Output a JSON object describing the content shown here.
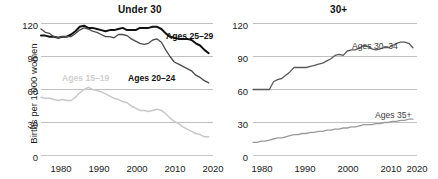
{
  "figure": {
    "ylabel": "Births per 1,000 women"
  },
  "panels": {
    "left": {
      "title": "Under 30",
      "yticks": [
        "120",
        "90",
        "60",
        "30",
        "0"
      ],
      "xticks": [
        "1980",
        "1990",
        "2000",
        "2010",
        "2020"
      ],
      "labels": {
        "ages_25_29": "Ages 25–29",
        "ages_20_24": "Ages 20–24",
        "ages_15_19": "Ages 15–19"
      }
    },
    "right": {
      "title": "30+",
      "yticks": [
        "120",
        "90",
        "60",
        "30",
        "0"
      ],
      "xticks": [
        "1980",
        "1990",
        "2000",
        "2010",
        "2020"
      ],
      "labels": {
        "ages_30_34": "Ages 30–34",
        "ages_35_plus": "Ages 35+"
      }
    }
  },
  "colors": {
    "ages_25_29": "#111111",
    "ages_20_24": "#4a4a4a",
    "ages_15_19": "#c8c8c8",
    "ages_30_34": "#5a5a5a",
    "ages_35_plus": "#9a9a9a",
    "gridline": "#b9b9b9",
    "axis_text": "#1a1a1a"
  },
  "chart_data": {
    "type": "line",
    "xlabel": "",
    "ylabel": "Births per 1,000 women",
    "xlim": [
      1980,
      2020
    ],
    "ylim": [
      0,
      120
    ],
    "grid": "horizontal",
    "legend": "inline-annotations",
    "panels": [
      {
        "name": "Under 30",
        "yticks": [
          0,
          30,
          60,
          90,
          120
        ],
        "xticks": [
          1980,
          1990,
          2000,
          2010,
          2020
        ],
        "series": [
          {
            "name": "Ages 25–29",
            "color": "#111111",
            "x": [
              1980,
              1981,
              1982,
              1983,
              1984,
              1985,
              1986,
              1987,
              1988,
              1989,
              1990,
              1991,
              1992,
              1993,
              1994,
              1995,
              1996,
              1997,
              1998,
              1999,
              2000,
              2001,
              2002,
              2003,
              2004,
              2005,
              2006,
              2007,
              2008,
              2009,
              2010,
              2011,
              2012,
              2013,
              2014,
              2015,
              2016,
              2017,
              2018,
              2019
            ],
            "values": [
              109,
              109,
              108,
              108,
              107,
              108,
              108,
              110,
              113,
              117,
              118,
              116,
              116,
              115,
              114,
              113,
              114,
              114,
              115,
              116,
              114,
              114,
              114,
              116,
              116,
              116,
              117,
              117,
              115,
              111,
              108,
              107,
              106,
              106,
              106,
              105,
              102,
              100,
              96,
              93
            ]
          },
          {
            "name": "Ages 20–24",
            "color": "#4a4a4a",
            "x": [
              1980,
              1981,
              1982,
              1983,
              1984,
              1985,
              1986,
              1987,
              1988,
              1989,
              1990,
              1991,
              1992,
              1993,
              1994,
              1995,
              1996,
              1997,
              1998,
              1999,
              2000,
              2001,
              2002,
              2003,
              2004,
              2005,
              2006,
              2007,
              2008,
              2009,
              2010,
              2011,
              2012,
              2013,
              2014,
              2015,
              2016,
              2017,
              2018,
              2019
            ],
            "values": [
              115,
              112,
              111,
              108,
              107,
              108,
              108,
              108,
              111,
              114,
              116,
              115,
              113,
              112,
              110,
              108,
              108,
              107,
              110,
              110,
              109,
              106,
              104,
              102,
              101,
              102,
              105,
              106,
              103,
              96,
              90,
              85,
              83,
              81,
              79,
              77,
              73,
              71,
              68,
              66
            ]
          },
          {
            "name": "Ages 15–19",
            "color": "#c8c8c8",
            "x": [
              1980,
              1981,
              1982,
              1983,
              1984,
              1985,
              1986,
              1987,
              1988,
              1989,
              1990,
              1991,
              1992,
              1993,
              1994,
              1995,
              1996,
              1997,
              1998,
              1999,
              2000,
              2001,
              2002,
              2003,
              2004,
              2005,
              2006,
              2007,
              2008,
              2009,
              2010,
              2011,
              2012,
              2013,
              2014,
              2015,
              2016,
              2017,
              2018,
              2019
            ],
            "values": [
              53,
              52,
              52,
              51,
              50,
              51,
              50,
              50,
              53,
              57,
              60,
              62,
              60,
              59,
              58,
              56,
              54,
              52,
              51,
              49,
              48,
              45,
              43,
              41,
              41,
              40,
              41,
              42,
              41,
              38,
              34,
              31,
              29,
              26,
              24,
              22,
              20,
              19,
              17,
              17
            ]
          }
        ]
      },
      {
        "name": "30+",
        "yticks": [
          0,
          30,
          60,
          90,
          120
        ],
        "xticks": [
          1980,
          1990,
          2000,
          2010,
          2020
        ],
        "series": [
          {
            "name": "Ages 30–34",
            "color": "#5a5a5a",
            "x": [
              1980,
              1981,
              1982,
              1983,
              1984,
              1985,
              1986,
              1987,
              1988,
              1989,
              1990,
              1991,
              1992,
              1993,
              1994,
              1995,
              1996,
              1997,
              1998,
              1999,
              2000,
              2001,
              2002,
              2003,
              2004,
              2005,
              2006,
              2007,
              2008,
              2009,
              2010,
              2011,
              2012,
              2013,
              2014,
              2015,
              2016,
              2017,
              2018,
              2019
            ],
            "values": [
              60,
              60,
              60,
              60,
              60,
              67,
              69,
              70,
              73,
              76,
              80,
              80,
              80,
              80,
              81,
              82,
              83,
              84,
              86,
              88,
              91,
              92,
              91,
              95,
              96,
              96,
              98,
              100,
              99,
              97,
              96,
              97,
              98,
              98,
              100,
              102,
              103,
              103,
              102,
              98
            ]
          },
          {
            "name": "Ages 35+",
            "color": "#9a9a9a",
            "x": [
              1980,
              1981,
              1982,
              1983,
              1984,
              1985,
              1986,
              1987,
              1988,
              1989,
              1990,
              1991,
              1992,
              1993,
              1994,
              1995,
              1996,
              1997,
              1998,
              1999,
              2000,
              2001,
              2002,
              2003,
              2004,
              2005,
              2006,
              2007,
              2008,
              2009,
              2010,
              2011,
              2012,
              2013,
              2014,
              2015,
              2016,
              2017,
              2018,
              2019
            ],
            "values": [
              12,
              12,
              13,
              13,
              14,
              15,
              16,
              16,
              17,
              18,
              19,
              19,
              20,
              20,
              21,
              21,
              22,
              22,
              23,
              23,
              24,
              24,
              25,
              25,
              26,
              26,
              27,
              28,
              28,
              28,
              29,
              29,
              30,
              30,
              31,
              31,
              32,
              32,
              33,
              33
            ]
          }
        ]
      }
    ]
  }
}
